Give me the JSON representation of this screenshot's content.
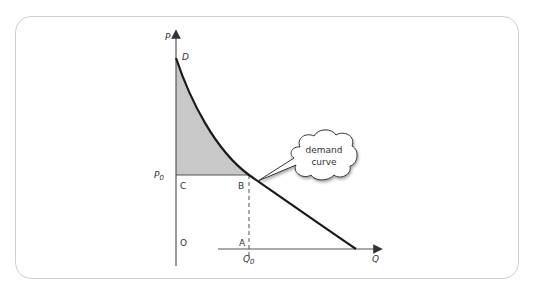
{
  "diagram": {
    "type": "consumer-surplus-demand-curve",
    "axes": {
      "y_label": "P",
      "x_label": "Q"
    },
    "labels": {
      "top_point": "D",
      "price_level": "P",
      "price_level_sub": "0",
      "quantity_level": "Q",
      "quantity_level_sub": "0",
      "point_c": "C",
      "point_b": "B",
      "origin": "O",
      "point_a": "A"
    },
    "callout": {
      "line1": "demand",
      "line2": "curve"
    },
    "colors": {
      "curve": "#1a1a1a",
      "axis": "#555555",
      "shaded_area": "#c8c8c8",
      "frame_border": "#cfcfcf"
    }
  }
}
